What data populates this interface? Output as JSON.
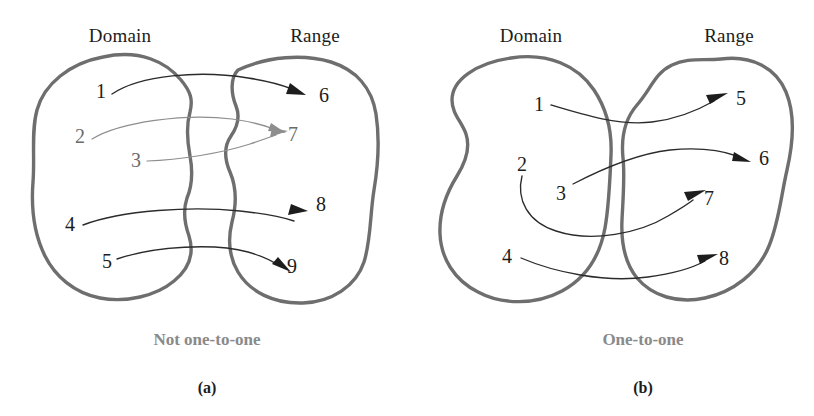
{
  "figure": {
    "width": 814,
    "height": 416,
    "background": "#ffffff",
    "outline_color": "#6e6e6e",
    "arrow_color": "#2b2b2b",
    "arrow_light_color": "#8e8e8e",
    "text_color": "#1c1c1c",
    "caption_color": "#8a8a8a"
  },
  "panels": [
    {
      "tag": "(a)",
      "caption": "Not one-to-one",
      "domain_label": "Domain",
      "range_label": "Range",
      "domain_items": [
        "1",
        "2",
        "3",
        "4",
        "5"
      ],
      "range_items": [
        "6",
        "7",
        "8",
        "9"
      ],
      "mappings": [
        {
          "from": "1",
          "to": "6"
        },
        {
          "from": "2",
          "to": "7"
        },
        {
          "from": "3",
          "to": "7"
        },
        {
          "from": "4",
          "to": "8"
        },
        {
          "from": "5",
          "to": "9"
        }
      ]
    },
    {
      "tag": "(b)",
      "caption": "One-to-one",
      "domain_label": "Domain",
      "range_label": "Range",
      "domain_items": [
        "1",
        "2",
        "3",
        "4"
      ],
      "range_items": [
        "5",
        "6",
        "7",
        "8"
      ],
      "mappings": [
        {
          "from": "1",
          "to": "5"
        },
        {
          "from": "3",
          "to": "6"
        },
        {
          "from": "2",
          "to": "7"
        },
        {
          "from": "4",
          "to": "8"
        }
      ]
    }
  ],
  "headers": {
    "a_domain": "Domain",
    "a_range": "Range",
    "b_domain": "Domain",
    "b_range": "Range"
  },
  "nodes_a": {
    "d1": "1",
    "d2": "2",
    "d3": "3",
    "d4": "4",
    "d5": "5",
    "r6": "6",
    "r7": "7",
    "r8": "8",
    "r9": "9"
  },
  "nodes_b": {
    "d1": "1",
    "d2": "2",
    "d3": "3",
    "d4": "4",
    "r5": "5",
    "r6": "6",
    "r7": "7",
    "r8": "8"
  },
  "captions": {
    "a": "Not one-to-one",
    "b": "One-to-one"
  },
  "tags": {
    "a": "(a)",
    "b": "(b)"
  }
}
